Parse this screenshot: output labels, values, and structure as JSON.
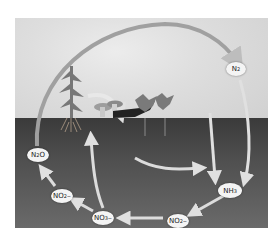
{
  "diagram": {
    "nodes": [
      {
        "id": "n2",
        "base": "N",
        "sub": "2",
        "sup": "",
        "x": 235,
        "y": 69
      },
      {
        "id": "n2o",
        "base": "N",
        "sub": "2",
        "sup": "",
        "tail": "O",
        "x": 37,
        "y": 155
      },
      {
        "id": "no2_left",
        "base": "NO",
        "sub": "2",
        "sup": "−",
        "x": 61,
        "y": 196
      },
      {
        "id": "no3",
        "base": "NO",
        "sub": "3",
        "sup": "−",
        "x": 102,
        "y": 218
      },
      {
        "id": "no2_right",
        "base": "NO",
        "sub": "2",
        "sup": "−",
        "x": 177,
        "y": 221
      },
      {
        "id": "nh3",
        "base": "NH",
        "sub": "3",
        "sup": "",
        "x": 229,
        "y": 191
      }
    ],
    "colors": {
      "arrow": "#d9d9d9",
      "arc": "#9a9a9a",
      "node_fill": "#f4f4f4",
      "sky": "#dedede",
      "soil": "#4a4a4a"
    }
  }
}
